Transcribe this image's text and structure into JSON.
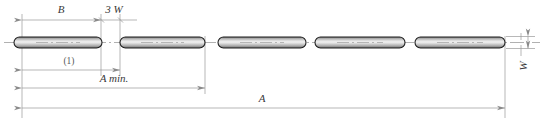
{
  "drawing": {
    "title": "rod-assembly-dimension-diagram",
    "type": "engineering-dimension-drawing",
    "background": "#ffffff",
    "line_color": "#8a8a8a",
    "outline_color": "#1f1f1f",
    "text_color": "#3a3a3a"
  },
  "dimensions": [
    {
      "id": "B",
      "label": "B",
      "orientation": "horizontal",
      "style": "italic",
      "x1": 22,
      "x2": 101,
      "y": 20,
      "text_x": 61,
      "text_y": 13
    },
    {
      "id": "3W",
      "label": "3 W",
      "orientation": "horizontal",
      "style": "italic",
      "x1": 101,
      "x2": 120,
      "y": 20,
      "text_x": 112,
      "text_y": 13
    },
    {
      "id": "one",
      "label": "(1)",
      "orientation": "horizontal",
      "style": "plain",
      "x1": 22,
      "x2": 120,
      "y": 70,
      "text_x": 68,
      "text_y": 63
    },
    {
      "id": "Amin",
      "label": "A min.",
      "orientation": "horizontal",
      "style": "italic",
      "x1": 22,
      "x2": 205,
      "y": 88,
      "text_x": 114,
      "text_y": 81
    },
    {
      "id": "A",
      "label": "A",
      "orientation": "horizontal",
      "style": "italic",
      "x1": 22,
      "x2": 505,
      "y": 108,
      "text_x": 262,
      "text_y": 101
    },
    {
      "id": "W",
      "label": "W",
      "orientation": "vertical",
      "style": "italic",
      "y1": 36,
      "y2": 48,
      "x": 528,
      "text_x": 527,
      "text_y": 66
    }
  ],
  "extension_lines": [
    {
      "id": "left-origin",
      "x": 22,
      "y1": 14,
      "y2": 118
    },
    {
      "id": "rod1-right",
      "x": 101,
      "y1": 14,
      "y2": 76
    },
    {
      "id": "rod2-left",
      "x": 120,
      "y1": 14,
      "y2": 76
    },
    {
      "id": "rod2-right",
      "x": 205,
      "y1": 36,
      "y2": 94
    },
    {
      "id": "rod5-right",
      "x": 505,
      "y1": 36,
      "y2": 118
    },
    {
      "id": "w-upper",
      "x": 521,
      "y1": 36,
      "y2": 40
    },
    {
      "id": "w-lower",
      "x": 521,
      "y1": 44,
      "y2": 52
    }
  ],
  "rods": [
    {
      "id": "rod-1",
      "x": 14,
      "width": 88,
      "y": 37,
      "height": 11
    },
    {
      "id": "rod-2",
      "x": 120,
      "width": 85,
      "y": 37,
      "height": 11
    },
    {
      "id": "rod-3",
      "x": 218,
      "width": 88,
      "y": 37,
      "height": 11
    },
    {
      "id": "rod-4",
      "x": 315,
      "width": 90,
      "y": 37,
      "height": 11
    },
    {
      "id": "rod-5",
      "x": 415,
      "width": 90,
      "y": 37,
      "height": 11
    }
  ],
  "centerline": {
    "id": "axis-centerline",
    "y": 42.5,
    "x1": 4,
    "x2": 540,
    "dash_pattern": "14 3 2 3"
  }
}
